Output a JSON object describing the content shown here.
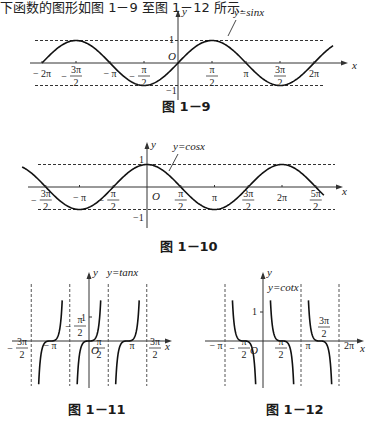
{
  "intro_text": "下函数的图形如图 1－9 至图 1－12 所示.",
  "figures": [
    {
      "caption": "图 1－9",
      "label": "y=sinx"
    },
    {
      "caption": "图 1－10",
      "label": "y=cosx"
    },
    {
      "caption": "图 1－11",
      "label": "y=tanx"
    },
    {
      "caption": "图 1－12",
      "label": "y=cotx"
    }
  ],
  "chart_data": [
    {
      "type": "line",
      "title": "图 1－9",
      "function": "y=sinx",
      "xlabel": "x",
      "ylabel": "y",
      "x_ticks": [
        "-2π",
        "-3π/2",
        "-π",
        "-π/2",
        "π/2",
        "π",
        "3π/2",
        "2π"
      ],
      "y_ticks": [
        "1",
        "-1"
      ],
      "origin_label": "O",
      "reference_lines": [
        1,
        -1
      ],
      "x_range": [
        "-2π",
        "2.3π"
      ],
      "ylim": [
        -1,
        1
      ]
    },
    {
      "type": "line",
      "title": "图 1－10",
      "function": "y=cosx",
      "xlabel": "x",
      "ylabel": "y",
      "x_ticks": [
        "-3π/2",
        "-π",
        "-π/2",
        "π/2",
        "π",
        "3π/2",
        "2π",
        "5π/2"
      ],
      "y_ticks": [
        "1",
        "-1"
      ],
      "origin_label": "O",
      "reference_lines": [
        1,
        -1
      ],
      "x_range": [
        "-1.85π",
        "2.65π"
      ],
      "ylim": [
        -1,
        1
      ]
    },
    {
      "type": "line",
      "title": "图 1－11",
      "function": "y=tanx",
      "xlabel": "x",
      "ylabel": "y",
      "x_ticks": [
        "-3π/2",
        "-π",
        "-π/2",
        "π/2",
        "π",
        "3π/2"
      ],
      "y_ticks": [
        "1"
      ],
      "origin_label": "O",
      "asymptotes": [
        "-3π/2",
        "-π/2",
        "π/2",
        "3π/2"
      ]
    },
    {
      "type": "line",
      "title": "图 1－12",
      "function": "y=cotx",
      "xlabel": "x",
      "ylabel": "y",
      "x_ticks": [
        "-π",
        "-π/2",
        "π/2",
        "π",
        "3π/2",
        "2π"
      ],
      "y_ticks": [
        "1"
      ],
      "origin_label": "O",
      "asymptotes": [
        "-π",
        "0",
        "π",
        "2π"
      ]
    }
  ]
}
